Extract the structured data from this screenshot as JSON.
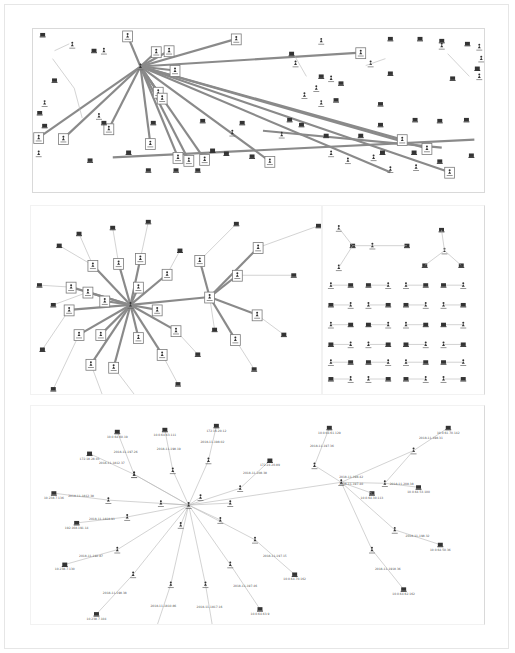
{
  "figure": {
    "panels": [
      {
        "id": "a",
        "name": "full-network-graph",
        "description": "Sparse network with one central hub connected to many distant host boxes"
      },
      {
        "id": "b",
        "name": "hub-star-graph",
        "description": "Star cluster centered on one hub with a secondary hub"
      },
      {
        "id": "c",
        "name": "small-components-grid",
        "description": "Grid of small disconnected user-host pairs"
      },
      {
        "id": "d",
        "name": "labeled-ip-graph",
        "description": "Labeled star graph of users and hosts with IP addresses"
      }
    ],
    "icons": {
      "host": "computer-monitor-icon",
      "user": "person-icon"
    },
    "colors": {
      "edge_heavy": "#8a8a8a",
      "edge_light": "#b5b5b5",
      "node": "#333333",
      "box_border": "#7a7a7a"
    }
  },
  "panel_d": {
    "hosts": [
      {
        "label": "10.0.64.60.19"
      },
      {
        "label": "10.0.64.63.111"
      },
      {
        "label": "172.16.20.12"
      },
      {
        "label": "172.18.28.03"
      },
      {
        "label": "10.238.7.136"
      },
      {
        "label": "192.168.191.14"
      },
      {
        "label": "10.238.7.130"
      },
      {
        "label": "10.238.7.104"
      },
      {
        "label": "10.238.7.100"
      },
      {
        "label": "10.238.7.152"
      },
      {
        "label": "10.0.64.63.9"
      },
      {
        "label": "10.0.64.70.162"
      },
      {
        "label": "172.24.20.89"
      },
      {
        "label": "10.0.64.61.129"
      },
      {
        "label": "10.0.61.70.142"
      },
      {
        "label": "10.0.64.53.100"
      },
      {
        "label": "10.0.64.50.36"
      },
      {
        "label": "10.0.64.62.162"
      },
      {
        "label": "10.0.64.30.113"
      }
    ],
    "edge_labels": [
      "2018-11-197.26",
      "2018-11-198.19",
      "2018-11-198.02",
      "2018-11-1812.37",
      "2018-11-1812.38",
      "2018-11-1818.91",
      "2018-11-192.87",
      "2018-11-198.38",
      "2018-11-1810.86",
      "2018-11-1817.16",
      "2018-11-197.46",
      "2018-11-197.15",
      "2018-11-208.38",
      "2018-11-197.36",
      "2018-11-198.31",
      "2018-11-208.38",
      "2018-11-198.32",
      "2018-11-1918.36",
      "2018-11-197.38",
      "2018-11-198.42",
      "2018-11-197.40"
    ]
  }
}
